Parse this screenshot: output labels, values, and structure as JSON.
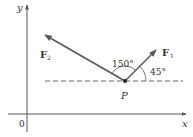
{
  "diagram": {
    "axes": {
      "x_label": "x",
      "y_label": "y",
      "origin_label": "0"
    },
    "point": {
      "label": "P"
    },
    "forces": [
      {
        "label_main": "F",
        "label_sub": "1",
        "angle_label": "45°"
      },
      {
        "label_main": "F",
        "label_sub": "2",
        "angle_label": "150°"
      }
    ],
    "colors": {
      "axis": "#555555",
      "vector": "#555555",
      "dashed": "#555555",
      "text": "#333333"
    }
  }
}
